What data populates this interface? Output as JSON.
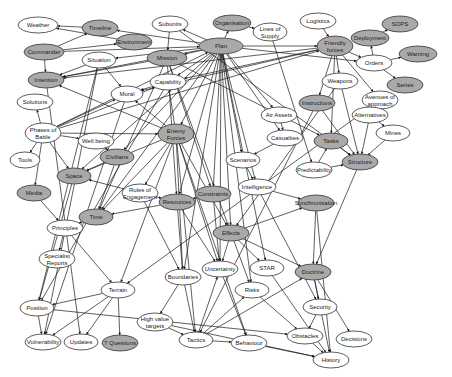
{
  "diagram": {
    "type": "concept-map",
    "colors": {
      "shaded_node": "#a9a9a9",
      "plain_node": "#ffffff",
      "edge": "#1a1a1a"
    },
    "nodes": [
      {
        "id": "weather",
        "label": "Weather",
        "x": 38,
        "y": 25,
        "rx": 20,
        "ry": 8,
        "shaded": false
      },
      {
        "id": "timeline",
        "label": "Timeline",
        "x": 100,
        "y": 28,
        "rx": 18,
        "ry": 8,
        "shaded": true
      },
      {
        "id": "environment",
        "label": "Environment",
        "x": 134,
        "y": 42,
        "rx": 18,
        "ry": 8,
        "shaded": true
      },
      {
        "id": "commander",
        "label": "Commander",
        "x": 44,
        "y": 52,
        "rx": 20,
        "ry": 8,
        "shaded": true
      },
      {
        "id": "situation",
        "label": "Situation",
        "x": 99,
        "y": 60,
        "rx": 17,
        "ry": 8,
        "shaded": false
      },
      {
        "id": "subunits",
        "label": "Subunits",
        "x": 170,
        "y": 24,
        "rx": 18,
        "ry": 8,
        "shaded": false
      },
      {
        "id": "organisation",
        "label": "Organisation",
        "x": 232,
        "y": 23,
        "rx": 19,
        "ry": 8,
        "shaded": true
      },
      {
        "id": "lines_of_supply",
        "label": "Lines of Supply",
        "x": 270,
        "y": 32,
        "rx": 17,
        "ry": 9,
        "shaded": false
      },
      {
        "id": "logistics",
        "label": "Logistics",
        "x": 318,
        "y": 21,
        "rx": 18,
        "ry": 8,
        "shaded": false
      },
      {
        "id": "sops",
        "label": "SOPS",
        "x": 400,
        "y": 24,
        "rx": 18,
        "ry": 8,
        "shaded": true
      },
      {
        "id": "deployment",
        "label": "Deployment",
        "x": 370,
        "y": 38,
        "rx": 19,
        "ry": 8,
        "shaded": true
      },
      {
        "id": "friendly_forces",
        "label": "Friendly forces",
        "x": 335,
        "y": 46,
        "rx": 18,
        "ry": 10,
        "shaded": true
      },
      {
        "id": "plan",
        "label": "Plan",
        "x": 221,
        "y": 46,
        "rx": 22,
        "ry": 8,
        "shaded": true
      },
      {
        "id": "mission",
        "label": "Mission",
        "x": 167,
        "y": 58,
        "rx": 20,
        "ry": 8,
        "shaded": true
      },
      {
        "id": "warning",
        "label": "Warning",
        "x": 418,
        "y": 54,
        "rx": 19,
        "ry": 8,
        "shaded": true
      },
      {
        "id": "orders",
        "label": "Orders",
        "x": 374,
        "y": 63,
        "rx": 18,
        "ry": 8,
        "shaded": false
      },
      {
        "id": "series",
        "label": "Series",
        "x": 405,
        "y": 85,
        "rx": 18,
        "ry": 8,
        "shaded": true
      },
      {
        "id": "intention",
        "label": "Intention",
        "x": 46,
        "y": 80,
        "rx": 18,
        "ry": 8,
        "shaded": true
      },
      {
        "id": "capability",
        "label": "Capability",
        "x": 168,
        "y": 82,
        "rx": 18,
        "ry": 8,
        "shaded": false
      },
      {
        "id": "moral",
        "label": "Moral",
        "x": 127,
        "y": 94,
        "rx": 16,
        "ry": 8,
        "shaded": false
      },
      {
        "id": "weapons",
        "label": "Weapons",
        "x": 340,
        "y": 81,
        "rx": 18,
        "ry": 8,
        "shaded": false
      },
      {
        "id": "avenues_of_approach",
        "label": "Avenues of approach",
        "x": 380,
        "y": 100,
        "rx": 18,
        "ry": 9,
        "shaded": false
      },
      {
        "id": "solutions",
        "label": "Solutions",
        "x": 35,
        "y": 102,
        "rx": 18,
        "ry": 8,
        "shaded": false
      },
      {
        "id": "instructions",
        "label": "Instructions",
        "x": 317,
        "y": 103,
        "rx": 18,
        "ry": 8,
        "shaded": true
      },
      {
        "id": "air_assets",
        "label": "Air Assets",
        "x": 279,
        "y": 115,
        "rx": 18,
        "ry": 8,
        "shaded": false
      },
      {
        "id": "alternatives",
        "label": "Alternatives",
        "x": 370,
        "y": 115,
        "rx": 18,
        "ry": 8,
        "shaded": false
      },
      {
        "id": "phases_of_battle",
        "label": "Phases of Battle",
        "x": 43,
        "y": 133,
        "rx": 18,
        "ry": 10,
        "shaded": false
      },
      {
        "id": "well_being",
        "label": "Well being",
        "x": 96,
        "y": 141,
        "rx": 18,
        "ry": 8,
        "shaded": false
      },
      {
        "id": "enemy_forces",
        "label": "Enemy Forces",
        "x": 176,
        "y": 134,
        "rx": 18,
        "ry": 10,
        "shaded": true
      },
      {
        "id": "casualties",
        "label": "Casualties",
        "x": 285,
        "y": 138,
        "rx": 18,
        "ry": 8,
        "shaded": false
      },
      {
        "id": "tasks",
        "label": "Tasks",
        "x": 331,
        "y": 141,
        "rx": 17,
        "ry": 8,
        "shaded": true
      },
      {
        "id": "mines",
        "label": "Mines",
        "x": 393,
        "y": 133,
        "rx": 17,
        "ry": 8,
        "shaded": false
      },
      {
        "id": "civilians",
        "label": "Civilians",
        "x": 117,
        "y": 157,
        "rx": 17,
        "ry": 8,
        "shaded": true
      },
      {
        "id": "tools",
        "label": "Tools",
        "x": 25,
        "y": 160,
        "rx": 15,
        "ry": 8,
        "shaded": false
      },
      {
        "id": "scenarios",
        "label": "Scenarios",
        "x": 243,
        "y": 160,
        "rx": 17,
        "ry": 8,
        "shaded": false
      },
      {
        "id": "structure",
        "label": "Structure",
        "x": 360,
        "y": 162,
        "rx": 18,
        "ry": 8,
        "shaded": true
      },
      {
        "id": "predictability",
        "label": "Predictability",
        "x": 314,
        "y": 170,
        "rx": 18,
        "ry": 8,
        "shaded": false
      },
      {
        "id": "space",
        "label": "Space",
        "x": 74,
        "y": 176,
        "rx": 17,
        "ry": 8,
        "shaded": true
      },
      {
        "id": "rules_of_engagement",
        "label": "Rules of Engagement",
        "x": 140,
        "y": 193,
        "rx": 18,
        "ry": 9,
        "shaded": false
      },
      {
        "id": "intelligence",
        "label": "Intelligence",
        "x": 257,
        "y": 187,
        "rx": 19,
        "ry": 8,
        "shaded": false
      },
      {
        "id": "media",
        "label": "Media",
        "x": 34,
        "y": 193,
        "rx": 17,
        "ry": 8,
        "shaded": true
      },
      {
        "id": "constraints",
        "label": "Constraints",
        "x": 213,
        "y": 194,
        "rx": 18,
        "ry": 8,
        "shaded": true
      },
      {
        "id": "resources",
        "label": "Resources",
        "x": 177,
        "y": 202,
        "rx": 18,
        "ry": 8,
        "shaded": true
      },
      {
        "id": "synchronisation",
        "label": "Synchronisation",
        "x": 316,
        "y": 203,
        "rx": 18,
        "ry": 8,
        "shaded": true
      },
      {
        "id": "time",
        "label": "Time",
        "x": 96,
        "y": 217,
        "rx": 17,
        "ry": 8,
        "shaded": true
      },
      {
        "id": "principles",
        "label": "Principles",
        "x": 65,
        "y": 228,
        "rx": 18,
        "ry": 8,
        "shaded": false
      },
      {
        "id": "effects",
        "label": "Effects",
        "x": 231,
        "y": 233,
        "rx": 18,
        "ry": 8,
        "shaded": true
      },
      {
        "id": "specialist_reports",
        "label": "Specialist Reports",
        "x": 57,
        "y": 259,
        "rx": 18,
        "ry": 9,
        "shaded": false
      },
      {
        "id": "uncertainty",
        "label": "Uncertainty",
        "x": 220,
        "y": 269,
        "rx": 18,
        "ry": 8,
        "shaded": false
      },
      {
        "id": "star",
        "label": "STAR",
        "x": 267,
        "y": 268,
        "rx": 17,
        "ry": 8,
        "shaded": false
      },
      {
        "id": "boundaries",
        "label": "Boundaries",
        "x": 183,
        "y": 277,
        "rx": 18,
        "ry": 8,
        "shaded": false
      },
      {
        "id": "doctrine",
        "label": "Doctrine",
        "x": 313,
        "y": 272,
        "rx": 18,
        "ry": 8,
        "shaded": true
      },
      {
        "id": "terrain",
        "label": "Terrain",
        "x": 118,
        "y": 290,
        "rx": 17,
        "ry": 8,
        "shaded": false
      },
      {
        "id": "risks",
        "label": "Risks",
        "x": 252,
        "y": 290,
        "rx": 17,
        "ry": 8,
        "shaded": false
      },
      {
        "id": "security",
        "label": "Security",
        "x": 320,
        "y": 307,
        "rx": 17,
        "ry": 8,
        "shaded": false
      },
      {
        "id": "position",
        "label": "Position",
        "x": 37,
        "y": 308,
        "rx": 17,
        "ry": 8,
        "shaded": false
      },
      {
        "id": "high_value_targets",
        "label": "High value targets",
        "x": 155,
        "y": 322,
        "rx": 18,
        "ry": 9,
        "shaded": false
      },
      {
        "id": "obstacles",
        "label": "Obstacles",
        "x": 305,
        "y": 336,
        "rx": 18,
        "ry": 8,
        "shaded": false
      },
      {
        "id": "decisions",
        "label": "Decisions",
        "x": 354,
        "y": 339,
        "rx": 18,
        "ry": 8,
        "shaded": false
      },
      {
        "id": "tactics",
        "label": "Tactics",
        "x": 196,
        "y": 340,
        "rx": 17,
        "ry": 8,
        "shaded": false
      },
      {
        "id": "behaviour",
        "label": "Behaviour",
        "x": 249,
        "y": 343,
        "rx": 18,
        "ry": 8,
        "shaded": false
      },
      {
        "id": "vulnerability",
        "label": "Vulnerability",
        "x": 43,
        "y": 342,
        "rx": 18,
        "ry": 8,
        "shaded": false
      },
      {
        "id": "updates",
        "label": "Updates",
        "x": 81,
        "y": 342,
        "rx": 17,
        "ry": 8,
        "shaded": false
      },
      {
        "id": "seven_questions",
        "label": "7 Questions",
        "x": 120,
        "y": 343,
        "rx": 18,
        "ry": 8,
        "shaded": true
      },
      {
        "id": "history",
        "label": "History",
        "x": 331,
        "y": 360,
        "rx": 18,
        "ry": 8,
        "shaded": false
      }
    ],
    "edges": [
      [
        "commander",
        "timeline"
      ],
      [
        "commander",
        "intention"
      ],
      [
        "commander",
        "plan"
      ],
      [
        "timeline",
        "weather"
      ],
      [
        "environment",
        "weather"
      ],
      [
        "commander",
        "environment"
      ],
      [
        "plan",
        "timeline"
      ],
      [
        "plan",
        "subunits"
      ],
      [
        "plan",
        "organisation"
      ],
      [
        "organisation",
        "lines_of_supply"
      ],
      [
        "plan",
        "friendly_forces"
      ],
      [
        "logistics",
        "friendly_forces"
      ],
      [
        "plan",
        "mission"
      ],
      [
        "subunits",
        "mission"
      ],
      [
        "plan",
        "situation"
      ],
      [
        "plan",
        "capability"
      ],
      [
        "plan",
        "intention"
      ],
      [
        "plan",
        "orders"
      ],
      [
        "deployment",
        "sops"
      ],
      [
        "orders",
        "deployment"
      ],
      [
        "orders",
        "warning"
      ],
      [
        "orders",
        "series"
      ],
      [
        "friendly_forces",
        "orders"
      ],
      [
        "friendly_forces",
        "weapons"
      ],
      [
        "friendly_forces",
        "intention"
      ],
      [
        "friendly_forces",
        "capability"
      ],
      [
        "friendly_forces",
        "instructions"
      ],
      [
        "friendly_forces",
        "moral"
      ],
      [
        "friendly_forces",
        "tasks"
      ],
      [
        "friendly_forces",
        "avenues_of_approach"
      ],
      [
        "situation",
        "intention"
      ],
      [
        "situation",
        "moral"
      ],
      [
        "capability",
        "moral"
      ],
      [
        "plan",
        "enemy_forces"
      ],
      [
        "plan",
        "air_assets"
      ],
      [
        "plan",
        "casualties"
      ],
      [
        "plan",
        "scenarios"
      ],
      [
        "plan",
        "effects"
      ],
      [
        "plan",
        "resources"
      ],
      [
        "plan",
        "constraints"
      ],
      [
        "plan",
        "time"
      ],
      [
        "plan",
        "space"
      ],
      [
        "plan",
        "civilians"
      ],
      [
        "plan",
        "uncertainty"
      ],
      [
        "plan",
        "risks"
      ],
      [
        "plan",
        "star"
      ],
      [
        "plan",
        "intelligence"
      ],
      [
        "plan",
        "boundaries"
      ],
      [
        "phases_of_battle",
        "solutions"
      ],
      [
        "phases_of_battle",
        "tools"
      ],
      [
        "phases_of_battle",
        "media"
      ],
      [
        "phases_of_battle",
        "well_being"
      ],
      [
        "phases_of_battle",
        "moral"
      ],
      [
        "phases_of_battle",
        "space"
      ],
      [
        "phases_of_battle",
        "capability"
      ],
      [
        "phases_of_battle",
        "friendly_forces"
      ],
      [
        "phases_of_battle",
        "plan"
      ],
      [
        "phases_of_battle",
        "enemy_forces"
      ],
      [
        "enemy_forces",
        "intention"
      ],
      [
        "enemy_forces",
        "capability"
      ],
      [
        "enemy_forces",
        "moral"
      ],
      [
        "enemy_forces",
        "effects"
      ],
      [
        "enemy_forces",
        "uncertainty"
      ],
      [
        "enemy_forces",
        "boundaries"
      ],
      [
        "enemy_forces",
        "time"
      ],
      [
        "enemy_forces",
        "space"
      ],
      [
        "enemy_forces",
        "rules_of_engagement"
      ],
      [
        "enemy_forces",
        "terrain"
      ],
      [
        "enemy_forces",
        "tactics"
      ],
      [
        "enemy_forces",
        "behaviour"
      ],
      [
        "mission",
        "intention"
      ],
      [
        "mission",
        "effects"
      ],
      [
        "mission",
        "tasks"
      ],
      [
        "mission",
        "resources"
      ],
      [
        "mission",
        "constraints"
      ],
      [
        "mission",
        "time"
      ],
      [
        "alternatives",
        "avenues_of_approach"
      ],
      [
        "alternatives",
        "mines"
      ],
      [
        "alternatives",
        "structure"
      ],
      [
        "weapons",
        "structure"
      ],
      [
        "instructions",
        "structure"
      ],
      [
        "mines",
        "structure"
      ],
      [
        "tasks",
        "structure"
      ],
      [
        "predictability",
        "structure"
      ],
      [
        "predictability",
        "tasks"
      ],
      [
        "structure",
        "doctrine"
      ],
      [
        "scenarios",
        "intelligence"
      ],
      [
        "casualties",
        "scenarios"
      ],
      [
        "air_assets",
        "casualties"
      ],
      [
        "intelligence",
        "synchronisation"
      ],
      [
        "effects",
        "synchronisation"
      ],
      [
        "effects",
        "uncertainty"
      ],
      [
        "effects",
        "star"
      ],
      [
        "effects",
        "risks"
      ],
      [
        "effects",
        "doctrine"
      ],
      [
        "constraints",
        "resources"
      ],
      [
        "constraints",
        "uncertainty"
      ],
      [
        "resources",
        "uncertainty"
      ],
      [
        "resources",
        "boundaries"
      ],
      [
        "resources",
        "time"
      ],
      [
        "rules_of_engagement",
        "space"
      ],
      [
        "rules_of_engagement",
        "resources"
      ],
      [
        "rules_of_engagement",
        "boundaries"
      ],
      [
        "well_being",
        "civilians"
      ],
      [
        "civilians",
        "space"
      ],
      [
        "civilians",
        "time"
      ],
      [
        "media",
        "principles"
      ],
      [
        "time",
        "principles"
      ],
      [
        "principles",
        "specialist_reports"
      ],
      [
        "principles",
        "terrain"
      ],
      [
        "terrain",
        "position"
      ],
      [
        "terrain",
        "updates"
      ],
      [
        "terrain",
        "seven_questions"
      ],
      [
        "terrain",
        "vulnerability"
      ],
      [
        "position",
        "obstacles"
      ],
      [
        "position",
        "vulnerability"
      ],
      [
        "boundaries",
        "high_value_targets"
      ],
      [
        "boundaries",
        "tactics"
      ],
      [
        "high_value_targets",
        "tactics"
      ],
      [
        "tactics",
        "behaviour"
      ],
      [
        "tactics",
        "risks"
      ],
      [
        "tactics",
        "doctrine"
      ],
      [
        "tactics",
        "uncertainty"
      ],
      [
        "uncertainty",
        "behaviour"
      ],
      [
        "doctrine",
        "security"
      ],
      [
        "doctrine",
        "decisions"
      ],
      [
        "doctrine",
        "history"
      ],
      [
        "security",
        "obstacles"
      ],
      [
        "obstacles",
        "history"
      ],
      [
        "behaviour",
        "history"
      ],
      [
        "synchronisation",
        "doctrine"
      ],
      [
        "synchronisation",
        "history"
      ],
      [
        "intelligence",
        "security"
      ],
      [
        "star",
        "history"
      ],
      [
        "risks",
        "obstacles"
      ],
      [
        "high_value_targets",
        "history"
      ],
      [
        "situation",
        "vulnerability"
      ],
      [
        "situation",
        "position"
      ],
      [
        "intention",
        "updates"
      ],
      [
        "capability",
        "position"
      ],
      [
        "moral",
        "vulnerability"
      ],
      [
        "space",
        "position"
      ],
      [
        "subunits",
        "structure"
      ],
      [
        "lines_of_supply",
        "predictability"
      ],
      [
        "instructions",
        "tactics"
      ],
      [
        "weapons",
        "effects"
      ],
      [
        "avenues_of_approach",
        "terrain"
      ]
    ]
  }
}
